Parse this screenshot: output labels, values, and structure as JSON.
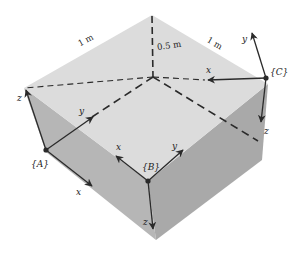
{
  "diagram": {
    "colors": {
      "top_face": "#dcdcdc",
      "left_face": "#b4b4b4",
      "right_face": "#a8a8a8",
      "lines": "#2a2a2a",
      "background": "#ffffff"
    },
    "dimensions": {
      "left_edge": "1 m",
      "right_edge": "1 m",
      "height": "0.5 m"
    },
    "frames": [
      {
        "name": "A",
        "label": "{A}",
        "axes": {
          "x": "x",
          "y": "y",
          "z": "z"
        }
      },
      {
        "name": "B",
        "label": "{B}",
        "axes": {
          "x": "x",
          "y": "y",
          "z": "z"
        }
      },
      {
        "name": "C",
        "label": "{C}",
        "axes": {
          "x": "x",
          "y": "y",
          "z": "z"
        }
      }
    ]
  }
}
